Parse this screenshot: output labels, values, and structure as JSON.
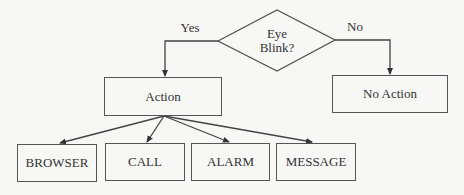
{
  "diagram": {
    "type": "flowchart",
    "decision": {
      "label_line1": "Eye",
      "label_line2": "Blink?"
    },
    "branches": {
      "yes_label": "Yes",
      "no_label": "No"
    },
    "nodes": {
      "action": "Action",
      "no_action": "No Action",
      "browser": "BROWSER",
      "call": "CALL",
      "alarm": "ALARM",
      "message": "MESSAGE"
    },
    "edges": [
      {
        "from": "Eye Blink?",
        "to": "Action",
        "label": "Yes"
      },
      {
        "from": "Eye Blink?",
        "to": "No Action",
        "label": "No"
      },
      {
        "from": "Action",
        "to": "BROWSER"
      },
      {
        "from": "Action",
        "to": "CALL"
      },
      {
        "from": "Action",
        "to": "ALARM"
      },
      {
        "from": "Action",
        "to": "MESSAGE"
      }
    ],
    "colors": {
      "line": "#444444",
      "text": "#333333",
      "background": "#f7f7f5"
    }
  }
}
